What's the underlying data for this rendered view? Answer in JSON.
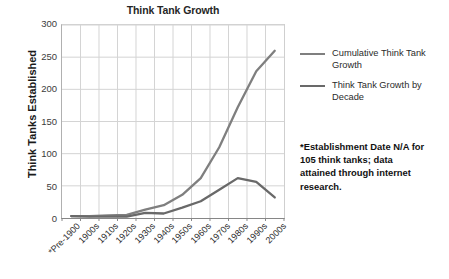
{
  "chart_data": {
    "type": "line",
    "title": "Think Tank Growth",
    "xlabel": "",
    "ylabel": "Think Tanks Established",
    "categories": [
      "*Pre-1900",
      "1900s",
      "1910s",
      "1920s",
      "1930s",
      "1940s",
      "1950s",
      "1960s",
      "1970s",
      "1980s",
      "1990s",
      "2000s"
    ],
    "series": [
      {
        "name": "Cumulative Think Tank Growth",
        "color": "#7f7f7f",
        "values": [
          3,
          3,
          4,
          5,
          13,
          20,
          36,
          62,
          110,
          172,
          228,
          260
        ]
      },
      {
        "name": "Think Tank Growth by Decade",
        "color": "#696969",
        "values": [
          3,
          2,
          2,
          2,
          8,
          7,
          16,
          26,
          44,
          62,
          56,
          32
        ]
      }
    ],
    "ylim": [
      0,
      300
    ],
    "yticks": [
      0,
      50,
      100,
      150,
      200,
      250,
      300
    ],
    "grid": true,
    "legend_position": "right",
    "annotations": [
      "*Establishment Date N/A for 105 think tanks; data attained through internet research."
    ]
  },
  "title": "Think Tank Growth",
  "y_axis": {
    "title": "Think Tanks Established",
    "ticks": [
      "300",
      "250",
      "200",
      "150",
      "100",
      "50",
      "0"
    ]
  },
  "x_axis": {
    "ticks": [
      "*Pre-1900",
      "1900s",
      "1910s",
      "1920s",
      "1930s",
      "1940s",
      "1950s",
      "1960s",
      "1970s",
      "1980s",
      "1990s",
      "2000s"
    ]
  },
  "legend": {
    "items": [
      {
        "label": "Cumulative Think Tank Growth",
        "color": "#7f7f7f"
      },
      {
        "label": "Think Tank Growth by Decade",
        "color": "#696969"
      }
    ]
  },
  "footnote": {
    "text": "*Establishment Date N/A for 105 think tanks; data attained through internet research."
  },
  "colors": {
    "cumulative": "#7f7f7f",
    "by_decade": "#696969",
    "grid": "#d4d4d4",
    "axis": "#868686",
    "text": "#262626"
  }
}
